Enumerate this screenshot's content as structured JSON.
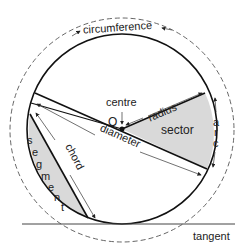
{
  "diagram": {
    "labels": {
      "circumference": "circumference",
      "centre": "centre",
      "centre_point": "O",
      "radius": "radius",
      "sector": "sector",
      "arc_a": "a",
      "arc_r": "r",
      "arc_c": "c",
      "diameter": "diameter",
      "chord": "chord",
      "segment": [
        "s",
        "e",
        "g",
        "m",
        "e",
        "n",
        "t"
      ],
      "tangent": "tangent"
    },
    "colors": {
      "line": "#111111",
      "shade": "#d9d9d9",
      "dashed": "#555555",
      "text": "#222222"
    }
  }
}
